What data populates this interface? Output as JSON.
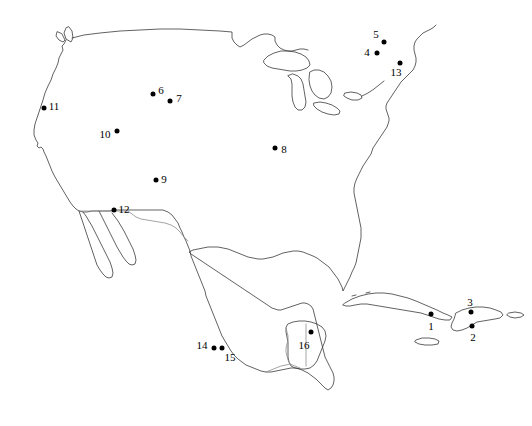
{
  "figure": {
    "name": "north-america-site-map",
    "width": 532,
    "height": 426,
    "background_color": "#ffffff",
    "coastline_color": "#3a3a3a",
    "border_color": "#8d8d8d",
    "point_color": "#000000"
  },
  "chart_data": {
    "type": "scatter",
    "title": "",
    "subtitle": "",
    "xlabel": "",
    "ylabel": "",
    "grid": false,
    "legend": "none",
    "projection_note": "North America outline map with numbered sampling localities",
    "basemap_features": [
      "United States coastline",
      "Canada southern border",
      "Great Lakes",
      "Mexico",
      "Baja California peninsula",
      "Yucatan peninsula",
      "Florida peninsula",
      "Cuba",
      "Jamaica",
      "Hispaniola",
      "Puerto Rico",
      "Central America"
    ],
    "points": [
      {
        "id": 1,
        "label": "1",
        "x": 431,
        "y": 314,
        "label_x": 431,
        "label_y": 326
      },
      {
        "id": 2,
        "label": "2",
        "x": 472,
        "y": 326,
        "label_x": 473,
        "label_y": 337
      },
      {
        "id": 3,
        "label": "3",
        "x": 471,
        "y": 312,
        "label_x": 470,
        "label_y": 302
      },
      {
        "id": 4,
        "label": "4",
        "x": 377,
        "y": 53,
        "label_x": 367,
        "label_y": 52
      },
      {
        "id": 5,
        "label": "5",
        "x": 384,
        "y": 42,
        "label_x": 376,
        "label_y": 34
      },
      {
        "id": 6,
        "label": "6",
        "x": 153,
        "y": 94,
        "label_x": 161,
        "label_y": 90
      },
      {
        "id": 7,
        "label": "7",
        "x": 170,
        "y": 101,
        "label_x": 179,
        "label_y": 98
      },
      {
        "id": 8,
        "label": "8",
        "x": 275,
        "y": 148,
        "label_x": 284,
        "label_y": 149
      },
      {
        "id": 9,
        "label": "9",
        "x": 156,
        "y": 180,
        "label_x": 164,
        "label_y": 179
      },
      {
        "id": 10,
        "label": "10",
        "x": 117,
        "y": 131,
        "label_x": 105,
        "label_y": 134
      },
      {
        "id": 11,
        "label": "11",
        "x": 44,
        "y": 108,
        "label_x": 54,
        "label_y": 106
      },
      {
        "id": 12,
        "label": "12",
        "x": 114,
        "y": 210,
        "label_x": 124,
        "label_y": 209
      },
      {
        "id": 13,
        "label": "13",
        "x": 400,
        "y": 63,
        "label_x": 396,
        "label_y": 72
      },
      {
        "id": 14,
        "label": "14",
        "x": 214,
        "y": 348,
        "label_x": 202,
        "label_y": 345
      },
      {
        "id": 15,
        "label": "15",
        "x": 222,
        "y": 348,
        "label_x": 230,
        "label_y": 357
      },
      {
        "id": 16,
        "label": "16",
        "x": 311,
        "y": 332,
        "label_x": 304,
        "label_y": 345
      }
    ]
  }
}
